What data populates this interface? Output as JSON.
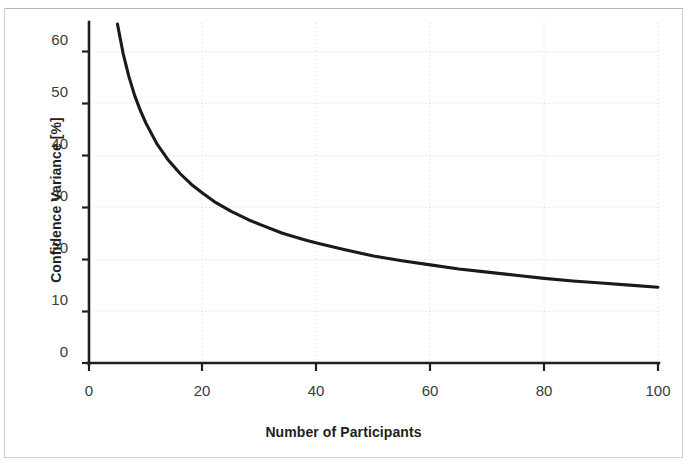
{
  "figure": {
    "name": "confidence-variance-vs-participants-chart",
    "background_color": "#ffffff",
    "border_color": "#cfcfcf",
    "line_color": "#1a1a1a",
    "grid_color": "#d9d9d9",
    "axis_color": "#231f20",
    "tick_label_color": "#3a3a3a"
  },
  "chart_data": {
    "type": "line",
    "title": "",
    "xlabel": "Number of Participants",
    "ylabel": "Confidence Variance [%]",
    "xlim": [
      0,
      100
    ],
    "ylim": [
      0,
      65
    ],
    "xticks": [
      0,
      20,
      40,
      60,
      80,
      100
    ],
    "yticks": [
      0,
      10,
      20,
      30,
      40,
      50,
      60
    ],
    "xtick_labels": [
      "0",
      "20",
      "40",
      "60",
      "80",
      "100"
    ],
    "ytick_labels": [
      "0",
      "10",
      "20",
      "30",
      "40",
      "50",
      "60"
    ],
    "grid": "horizontal-and-vertical-dotted",
    "legend": "none",
    "series": [
      {
        "name": "Confidence Variance",
        "relation": "146 / sqrt(n)",
        "x": [
          5,
          6,
          7,
          8,
          9,
          10,
          12,
          14,
          16,
          18,
          20,
          22,
          25,
          28,
          30,
          34,
          38,
          40,
          45,
          50,
          55,
          60,
          65,
          70,
          75,
          80,
          85,
          90,
          95,
          100
        ],
        "values": [
          65.3,
          59.6,
          55.2,
          51.6,
          48.7,
          46.2,
          42.1,
          39.0,
          36.5,
          34.4,
          32.7,
          31.1,
          29.2,
          27.6,
          26.7,
          25.0,
          23.7,
          23.1,
          21.8,
          20.6,
          19.7,
          18.9,
          18.1,
          17.5,
          16.9,
          16.3,
          15.8,
          15.4,
          15.0,
          14.6
        ]
      }
    ]
  }
}
